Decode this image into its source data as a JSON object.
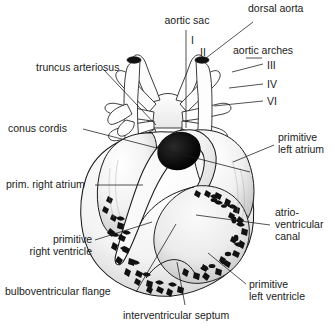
{
  "figure": {
    "background_color": "#ffffff",
    "ink_color": "#1a1a1a",
    "width": 335,
    "height": 326
  },
  "labels": {
    "aortic_sac": "aortic sac",
    "dorsal_aorta": "dorsal aorta",
    "aortic_arches": "aortic arches",
    "truncus_arteriosus": "truncus arteriosus",
    "conus_cordis": "conus cordis",
    "prim_right_atrium": "prim. right atrium",
    "primitive_left_atrium_l1": "primitive",
    "primitive_left_atrium_l2": "left atrium",
    "atrioventricular_canal_l1": "atrio-",
    "atrioventricular_canal_l2": "ventricular",
    "atrioventricular_canal_l3": "canal",
    "primitive_right_ventricle_l1": "primitive",
    "primitive_right_ventricle_l2": "right ventricle",
    "primitive_left_ventricle_l1": "primitive",
    "primitive_left_ventricle_l2": "left ventricle",
    "bulboventricular_flange": "bulboventricular flange",
    "interventricular_septum": "interventricular septum"
  },
  "arch_numerals": {
    "arch_1": "I",
    "arch_2": "II",
    "arch_3": "III",
    "arch_4": "IV",
    "arch_6": "VI"
  }
}
